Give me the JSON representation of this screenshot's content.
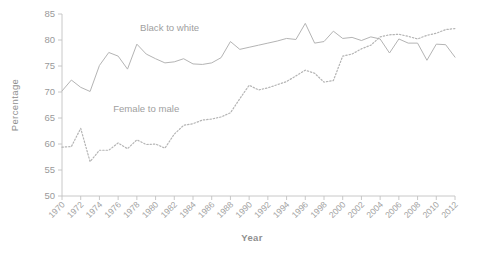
{
  "chart_data": {
    "type": "line",
    "title": "",
    "xlabel": "Year",
    "ylabel": "Percentage",
    "xlim": [
      1970,
      2012
    ],
    "ylim": [
      50,
      85
    ],
    "ytick_step": 5,
    "xtick_step": 2,
    "grid": false,
    "legend_position": "inline-annotation",
    "yticks": [
      "50",
      "55",
      "60",
      "65",
      "70",
      "75",
      "80",
      "85"
    ],
    "xticks": [
      "1970",
      "1972",
      "1974",
      "1976",
      "1978",
      "1980",
      "1982",
      "1984",
      "1986",
      "1988",
      "1990",
      "1992",
      "1994",
      "1996",
      "1998",
      "2000",
      "2002",
      "2004",
      "2006",
      "2008",
      "2012"
    ],
    "x": [
      1970,
      1971,
      1972,
      1973,
      1974,
      1975,
      1976,
      1977,
      1978,
      1979,
      1980,
      1981,
      1982,
      1983,
      1984,
      1985,
      1986,
      1987,
      1988,
      1989,
      1990,
      1991,
      1992,
      1993,
      1994,
      1995,
      1996,
      1997,
      1998,
      1999,
      2000,
      2001,
      2002,
      2003,
      2004,
      2005,
      2006,
      2007,
      2008,
      2009,
      2010,
      2011,
      2012
    ],
    "series": [
      {
        "name": "Black to white",
        "style": "solid",
        "color": "#b4b4b4",
        "annotation": "Black to white",
        "annotation_x": 1981.5,
        "annotation_y": 81.8,
        "values": [
          70.2,
          72.3,
          70.9,
          70.1,
          75.1,
          77.6,
          76.9,
          74.4,
          79.2,
          77.3,
          76.4,
          75.6,
          75.8,
          76.4,
          75.4,
          75.3,
          75.6,
          76.6,
          79.7,
          78.2,
          78.6,
          79.0,
          79.4,
          79.8,
          80.3,
          80.1,
          83.2,
          79.4,
          79.7,
          81.7,
          80.3,
          80.5,
          79.9,
          80.6,
          80.2,
          77.5,
          80.2,
          79.4,
          79.4,
          76.1,
          79.2,
          79.1,
          76.7
        ]
      },
      {
        "name": "Female to male",
        "style": "dotted",
        "color": "#b4b4b4",
        "annotation": "Female to male",
        "annotation_x": 1979.0,
        "annotation_y": 66.1,
        "values": [
          59.4,
          59.5,
          63.0,
          56.6,
          58.8,
          58.8,
          60.2,
          59.1,
          60.8,
          59.9,
          60.0,
          59.2,
          61.9,
          63.6,
          63.9,
          64.6,
          64.8,
          65.2,
          66.0,
          68.7,
          71.3,
          70.4,
          70.8,
          71.4,
          72.0,
          73.1,
          74.2,
          73.6,
          71.9,
          72.2,
          76.9,
          77.3,
          78.3,
          79.0,
          80.6,
          81.0,
          81.1,
          80.7,
          80.2,
          80.9,
          81.3,
          82.0,
          82.2
        ]
      }
    ]
  }
}
